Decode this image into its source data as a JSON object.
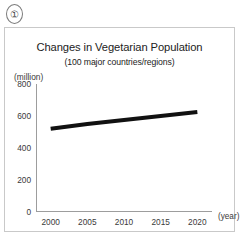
{
  "marker": {
    "label": "①",
    "icon": "circled-number-one-icon"
  },
  "chart_data": {
    "type": "line",
    "title": "Changes in Vegetarian Population",
    "subtitle": "(100 major countries/regions)",
    "xlabel": "(year)",
    "ylabel": "(million)",
    "categories": [
      2000,
      2005,
      2010,
      2015,
      2020
    ],
    "x_tick_labels": [
      "2000",
      "2005",
      "2010",
      "2015",
      "2020"
    ],
    "y_tick_labels": [
      "0",
      "200",
      "400",
      "600",
      "800"
    ],
    "y_ticks": [
      0,
      200,
      400,
      600,
      800
    ],
    "ylim": [
      0,
      800
    ],
    "xlim": [
      1998,
      2022
    ],
    "grid": false,
    "legend": null,
    "series": [
      {
        "name": "Vegetarian population",
        "color": "#111111",
        "line_width": 4,
        "values": [
          520,
          550,
          575,
          600,
          625
        ]
      }
    ]
  }
}
